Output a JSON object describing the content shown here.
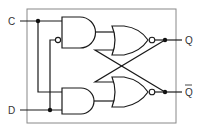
{
  "diagram": {
    "inputs": [
      {
        "id": "C",
        "label": "C"
      },
      {
        "id": "D",
        "label": "D"
      }
    ],
    "outputs": [
      {
        "id": "Q",
        "label": "Q"
      },
      {
        "id": "Qbar",
        "label": "Q",
        "overline": true
      }
    ],
    "gates": [
      {
        "id": "and_top",
        "type": "AND",
        "inputs": [
          "C",
          "NOT D"
        ],
        "output": "to nor_top"
      },
      {
        "id": "and_bottom",
        "type": "AND",
        "inputs": [
          "C",
          "D"
        ],
        "output": "to nor_bottom"
      },
      {
        "id": "nor_top",
        "type": "NOR",
        "inputs": [
          "and_top",
          "Qbar"
        ],
        "output": "Q"
      },
      {
        "id": "nor_bottom",
        "type": "NOR",
        "inputs": [
          "Q",
          "and_bottom"
        ],
        "output": "Qbar"
      }
    ],
    "colors": {
      "line": "#1a1a1a",
      "border": "#888888",
      "background": "#ffffff"
    }
  }
}
